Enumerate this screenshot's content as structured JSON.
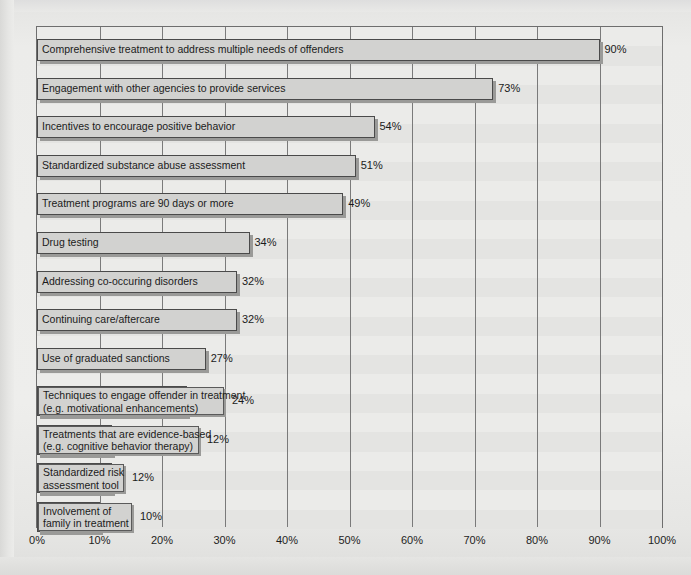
{
  "chart_data": {
    "type": "bar",
    "orientation": "horizontal",
    "title": "",
    "subtitle": "",
    "xlabel": "",
    "ylabel": "",
    "xlim": [
      0,
      100
    ],
    "xtick_labels": [
      "0%",
      "10%",
      "20%",
      "30%",
      "40%",
      "50%",
      "60%",
      "70%",
      "80%",
      "90%",
      "100%"
    ],
    "xtick_values": [
      0,
      10,
      20,
      30,
      40,
      50,
      60,
      70,
      80,
      90,
      100
    ],
    "grid": "vertical gridlines at every 10%, faint horizontal alternating bands",
    "legend": "none",
    "value_label_suffix": "%",
    "categories": [
      "Comprehensive treatment to address multiple needs of offenders",
      "Engagement with other agencies to provide services",
      "Incentives to encourage positive behavior",
      "Standardized substance abuse assessment",
      "Treatment programs are 90 days or more",
      "Drug testing",
      "Addressing co-occuring disorders",
      "Continuing care/aftercare",
      "Use of graduated sanctions",
      "Techniques to engage offender in treatment (e.g. motivational enhancements)",
      "Treatments that are evidence-based (e.g. cognitive behavior therapy)",
      "Standardized risk assessment tool",
      "Involvement of family in treatment"
    ],
    "values": [
      90,
      73,
      54,
      51,
      49,
      34,
      32,
      32,
      27,
      24,
      12,
      12,
      10
    ],
    "value_labels": [
      "90%",
      "73%",
      "54%",
      "51%",
      "49%",
      "34%",
      "32%",
      "32%",
      "27%",
      "24%",
      "12%",
      "12%",
      "10%"
    ]
  },
  "bars": [
    {
      "label_lines": [
        "Comprehensive treatment to address multiple needs of offenders"
      ],
      "value": 90,
      "value_label": "90%",
      "label_inside": true,
      "label_width": 0
    },
    {
      "label_lines": [
        "Engagement with other agencies to provide services"
      ],
      "value": 73,
      "value_label": "73%",
      "label_inside": true,
      "label_width": 0
    },
    {
      "label_lines": [
        "Incentives to encourage positive behavior"
      ],
      "value": 54,
      "value_label": "54%",
      "label_inside": true,
      "label_width": 0
    },
    {
      "label_lines": [
        "Standardized substance abuse assessment"
      ],
      "value": 51,
      "value_label": "51%",
      "label_inside": true,
      "label_width": 0
    },
    {
      "label_lines": [
        "Treatment programs are 90 days or more"
      ],
      "value": 49,
      "value_label": "49%",
      "label_inside": true,
      "label_width": 0
    },
    {
      "label_lines": [
        "Drug testing"
      ],
      "value": 34,
      "value_label": "34%",
      "label_inside": true,
      "label_width": 0
    },
    {
      "label_lines": [
        "Addressing co-occuring disorders"
      ],
      "value": 32,
      "value_label": "32%",
      "label_inside": true,
      "label_width": 0
    },
    {
      "label_lines": [
        "Continuing care/aftercare"
      ],
      "value": 32,
      "value_label": "32%",
      "label_inside": true,
      "label_width": 0
    },
    {
      "label_lines": [
        "Use of graduated sanctions"
      ],
      "value": 27,
      "value_label": "27%",
      "label_inside": true,
      "label_width": 0
    },
    {
      "label_lines": [
        "Techniques to engage offender in treatment",
        "(e.g. motivational enhancements)"
      ],
      "value": 24,
      "value_label": "24%",
      "label_inside": false,
      "label_width": 186
    },
    {
      "label_lines": [
        "Treatments that are evidence-based",
        "(e.g. cognitive behavior therapy)"
      ],
      "value": 12,
      "value_label": "12%",
      "label_inside": false,
      "label_width": 161
    },
    {
      "label_lines": [
        "Standardized risk",
        "assessment tool"
      ],
      "value": 12,
      "value_label": "12%",
      "label_inside": false,
      "label_width": 86
    },
    {
      "label_lines": [
        "Involvement of",
        "family in treatment"
      ],
      "value": 10,
      "value_label": "10%",
      "label_inside": false,
      "label_width": 94
    }
  ],
  "colors": {
    "bar_fill": "#d2d2d0",
    "bar_border": "#4a4a4a",
    "bar_shadow": "#9a9a98",
    "plot_background": "#ebebe9",
    "band": "#e4e4e2",
    "gridline": "#7a7a7a",
    "frame": "#6e6e6e",
    "text": "#1b1b1b",
    "page_background": "#e8e8e6"
  }
}
